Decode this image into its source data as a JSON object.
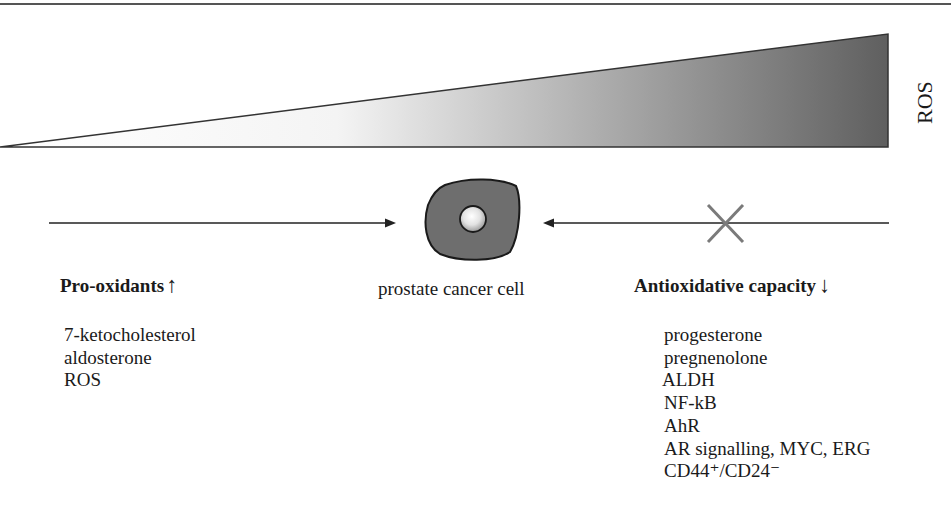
{
  "gradient": {
    "axis_label": "ROS",
    "from_color": "#ffffff",
    "to_color": "#6a6a6a"
  },
  "center": {
    "cell_label": "prostate cancer cell",
    "cell_color": "#6e6e6e"
  },
  "left_panel": {
    "heading": "Pro-oxidants",
    "heading_arrow": "↑",
    "items": [
      "7-ketocholesterol",
      "aldosterone",
      "ROS"
    ]
  },
  "right_panel": {
    "heading": "Antioxidative capacity",
    "heading_arrow": "↓",
    "blocked_marker": "×",
    "items": [
      "progesterone",
      "pregnenolone",
      "ALDH",
      "NF-kB",
      "AhR",
      "AR signalling, MYC, ERG",
      "CD44⁺/CD24⁻"
    ]
  }
}
